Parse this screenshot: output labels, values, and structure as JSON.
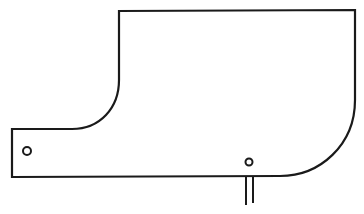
{
  "diagram": {
    "type": "line-drawing",
    "stroke_color": "#1a1a1a",
    "background_color": "#ffffff",
    "parts": [
      {
        "name": "plate-outline",
        "kind": "closed-path"
      },
      {
        "name": "left-tab-hole",
        "kind": "circle",
        "cx": 27,
        "cy": 151,
        "r": 4
      },
      {
        "name": "bottom-hole",
        "kind": "circle",
        "cx": 249,
        "cy": 162,
        "r": 3.5
      },
      {
        "name": "lead-left",
        "kind": "line",
        "x": 246,
        "y1": 177,
        "y2": 205
      },
      {
        "name": "lead-right",
        "kind": "line",
        "x": 253,
        "y1": 177,
        "y2": 203
      }
    ]
  }
}
